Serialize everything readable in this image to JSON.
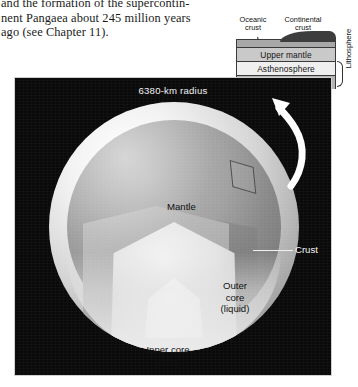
{
  "body_text": {
    "lines": [
      "and the formation of the supercontin-",
      "nent Pangaea about 245 million years",
      "ago (see Chapter 11)."
    ]
  },
  "legend": {
    "name": "crust-cross-section-inset",
    "headers": {
      "oceanic": "Oceanic\ncrust",
      "oceanic_line1": "Oceanic",
      "oceanic_line2": "crust",
      "continental_line1": "Continental",
      "continental_line2": "crust"
    },
    "layers": [
      {
        "label": "",
        "color": "#a8a8a8",
        "name": "crust-band"
      },
      {
        "label": "Upper mantle",
        "color": "#c9c9c9",
        "name": "upper-mantle-band"
      },
      {
        "label": "Asthenosphere",
        "color": "#efefef",
        "name": "asthenosphere-band"
      },
      {
        "label": "Lower mantle",
        "color": "#b4b4b4",
        "name": "lower-mantle-band"
      }
    ],
    "bracket_label": "Lithosphere"
  },
  "figure": {
    "radius_label": "6380-km radius",
    "labels": {
      "mantle": "Mantle",
      "outer_core_line1": "Outer",
      "outer_core_line2": "core",
      "outer_core_line3": "(liquid)",
      "inner_core_line1": "Inner core",
      "inner_core_line2": "(solid)",
      "crust": "Crust"
    },
    "colors": {
      "background": "#0a0a0a",
      "mantle": "#8f8f8f",
      "outer_core": "#e3e3e3",
      "inner_core": "#ffffff",
      "crust_shell": "#d2d2d2",
      "label_light": "#f2f2f2",
      "label_dark": "#111111"
    }
  }
}
